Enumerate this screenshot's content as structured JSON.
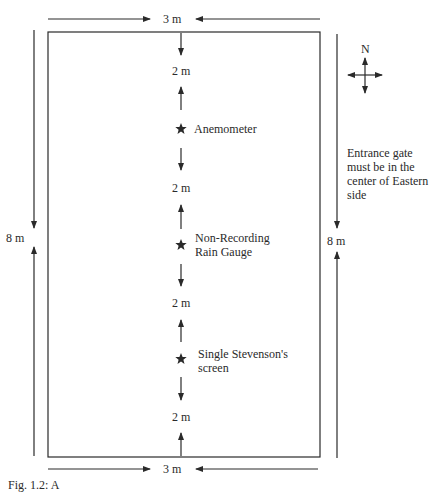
{
  "diagram": {
    "width_label": "3 m",
    "length_label": "8 m",
    "spacing_label": "2 m",
    "compass_label": "N",
    "instruments": [
      {
        "name": "Anemometer",
        "icon": "star-icon"
      },
      {
        "name": "Non-Recording\nRain Gauge",
        "icon": "star-icon"
      },
      {
        "name": "Single Stevenson's\nscreen",
        "icon": "star-icon"
      }
    ],
    "note": "Entrance gate\nmust be in the\ncenter of Eastern\nside",
    "caption": "Fig. 1.2: A"
  }
}
